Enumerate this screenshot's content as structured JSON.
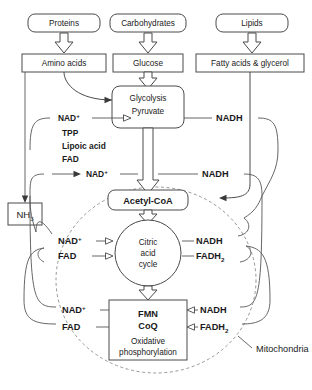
{
  "diagram": {
    "compartment_label": "Mitochondria",
    "nodes": {
      "proteins": "Proteins",
      "carbohydrates": "Carbohydrates",
      "lipids": "Lipids",
      "amino_acids": "Amino acids",
      "glucose": "Glucose",
      "fatty_acids": "Fatty acids & glycerol",
      "glycolysis_line1": "Glycolysis",
      "glycolysis_line2": "Pyruvate",
      "acetyl_coa": "Acetyl-CoA",
      "ammonia": "NH",
      "ammonia_sub": "3",
      "citric_l1": "Citric",
      "citric_l2": "acid",
      "citric_l3": "cycle",
      "oxphos_l1": "FMN",
      "oxphos_l2": "CoQ",
      "oxphos_l3": "Oxidative",
      "oxphos_l4": "phosphorylation"
    },
    "cofactors": {
      "tpp": "TPP",
      "lipoic_acid": "Lipoic acid",
      "fad": "FAD"
    },
    "carriers": {
      "nad_plus": "NAD",
      "nad_plus_sup": "+",
      "nadh": "NADH",
      "fad": "FAD",
      "fadh2": "FADH",
      "fadh2_sub": "2"
    },
    "labels": {
      "pyruvate_nad_in": "NAD",
      "pyruvate_nadh_out": "NADH",
      "glycolysis_nad_in": "NAD",
      "glycolysis_nadh_out": "NADH",
      "citric_nad_in": "NAD",
      "citric_fad_in": "FAD",
      "citric_nadh_out": "NADH",
      "citric_fadh2_out": "FADH",
      "oxphos_nad_out": "NAD",
      "oxphos_fad_out": "FAD",
      "oxphos_nadh_in": "NADH",
      "oxphos_fadh2_in": "FADH"
    },
    "colors": {
      "stroke": "#4a4a4a",
      "dashed_membrane": "#8a8a8a",
      "text": "#1a1a1a",
      "background": "#ffffff"
    }
  }
}
